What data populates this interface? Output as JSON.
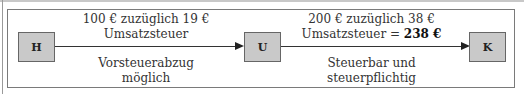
{
  "diagram": {
    "nodes": [
      {
        "id": "H",
        "label": "H"
      },
      {
        "id": "U",
        "label": "U"
      },
      {
        "id": "K",
        "label": "K"
      }
    ],
    "edges": [
      {
        "from": "H",
        "to": "U",
        "above_line1": "100 € zuzüglich 19 €",
        "above_line2": "Umsatzsteuer",
        "below_line1": "Vorsteuerabzug",
        "below_line2": "möglich"
      },
      {
        "from": "U",
        "to": "K",
        "above_line1": "200 € zuzüglich 38 €",
        "above_line2_prefix": "Umsatzsteuer = ",
        "above_line2_bold": "238 €",
        "below_line1": "Steuerbar und",
        "below_line2": "steuerpflichtig"
      }
    ]
  }
}
